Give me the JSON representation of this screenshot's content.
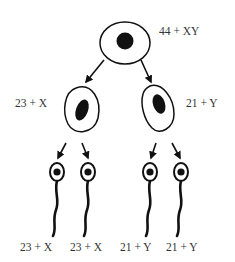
{
  "colors": {
    "stroke": "#111111",
    "nucleus": "#111111",
    "text": "#333333",
    "background": "#ffffff"
  },
  "parent_cell": {
    "label": "44 + XY"
  },
  "secondary_cells": [
    {
      "label": "23 + X"
    },
    {
      "label": "21 + Y"
    }
  ],
  "gametes": [
    {
      "label": "23 + X"
    },
    {
      "label": "23 + X"
    },
    {
      "label": "21 + Y"
    },
    {
      "label": "21 + Y"
    }
  ]
}
